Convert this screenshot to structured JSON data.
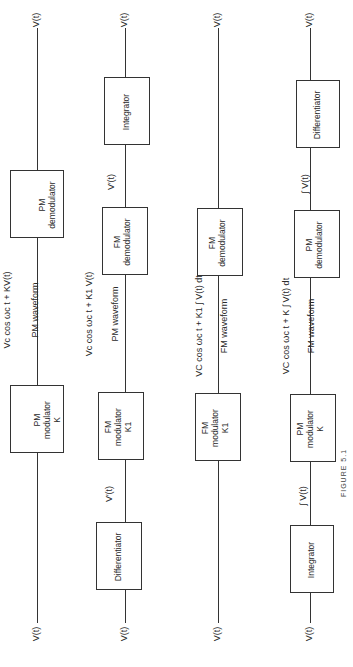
{
  "figure": {
    "orientation": "rotated 90deg counter-clockwise",
    "caption": "FIGURE 5.1"
  },
  "chains": [
    {
      "input": "V(t)",
      "output": "V(t)",
      "blocks": [
        {
          "lines": [
            "PM",
            "modulator",
            "K"
          ]
        },
        {
          "lines": [
            "PM",
            "demodulator"
          ]
        }
      ],
      "between": [
        {
          "line1": "V_c cos ω_c t + KV(t)",
          "line2": "PM waveform"
        }
      ]
    },
    {
      "input": "V(t)",
      "output": "V(t)",
      "blocks": [
        {
          "lines": [
            "Differentiator"
          ]
        },
        {
          "lines": [
            "FM",
            "modulator",
            "K₁"
          ]
        },
        {
          "lines": [
            "FM",
            "demodulator"
          ]
        },
        {
          "lines": [
            "Integrator"
          ]
        }
      ],
      "between": [
        {
          "line1": "V′(t)"
        },
        {
          "line1": "V_c cos ω_c t + K₁ V(t)",
          "line2": "PM waveform"
        },
        {
          "line1": "V′(t)"
        }
      ]
    },
    {
      "input": "V(t)",
      "output": "V(t)",
      "blocks": [
        {
          "lines": [
            "FM",
            "modulator",
            "K₁"
          ]
        },
        {
          "lines": [
            "FM",
            "demodulator"
          ]
        }
      ],
      "between": [
        {
          "line1": "V_C cos ω_c t + K₁ ∫ V(t) dt",
          "line2": "FM waveform"
        }
      ]
    },
    {
      "input": "V(t)",
      "output": "V(t)",
      "blocks": [
        {
          "lines": [
            "Integrator"
          ]
        },
        {
          "lines": [
            "PM",
            "modulator",
            "K"
          ]
        },
        {
          "lines": [
            "PM",
            "demodulator"
          ]
        },
        {
          "lines": [
            "Differentiator"
          ]
        }
      ],
      "between": [
        {
          "line1": "∫ V(t)"
        },
        {
          "line1": "V_C cos ω_c t + K ∫ V(t) dt",
          "line2": "FM waveform"
        },
        {
          "line1": "∫ V(t)"
        }
      ]
    }
  ],
  "labels": {
    "c1_in": "V(t)",
    "c1_out": "V(t)",
    "c1_b1_l1": "PM",
    "c1_b1_l2": "modulator",
    "c1_b1_l3": "K",
    "c1_b2_l1": "PM",
    "c1_b2_l2": "demodulator",
    "c1_s1_l1": "Vc cos ωc t + KV(t)",
    "c1_s1_l2": "PM waveform",
    "c2_in": "V(t)",
    "c2_out": "V(t)",
    "c2_b1_l1": "Differentiator",
    "c2_b2_l1": "FM",
    "c2_b2_l2": "modulator",
    "c2_b2_l3": "K1",
    "c2_b3_l1": "FM",
    "c2_b3_l2": "demodulator",
    "c2_b4_l1": "Integrator",
    "c2_s1": "V′(t)",
    "c2_s2_l1": "Vc cos ωc t + K1 V(t)",
    "c2_s2_l2": "PM waveform",
    "c2_s3": "V′(t)",
    "c3_in": "V(t)",
    "c3_out": "V(t)",
    "c3_b1_l1": "FM",
    "c3_b1_l2": "modulator",
    "c3_b1_l3": "K1",
    "c3_b2_l1": "FM",
    "c3_b2_l2": "demodulator",
    "c3_s1_l1": "VC cos ωc t + K1 ∫ V(t) dt",
    "c3_s1_l2": "FM waveform",
    "c4_in": "V(t)",
    "c4_out": "V(t)",
    "c4_b1_l1": "Integrator",
    "c4_b2_l1": "PM",
    "c4_b2_l2": "modulator",
    "c4_b2_l3": "K",
    "c4_b3_l1": "PM",
    "c4_b3_l2": "demodulator",
    "c4_b4_l1": "Differentiator",
    "c4_s1": "∫ V(t)",
    "c4_s2_l1": "VC cos ωc t + K ∫ V(t) dt",
    "c4_s2_l2": "FM waveform",
    "c4_s3": "∫ V(t)",
    "caption": "FIGURE 5.1"
  }
}
